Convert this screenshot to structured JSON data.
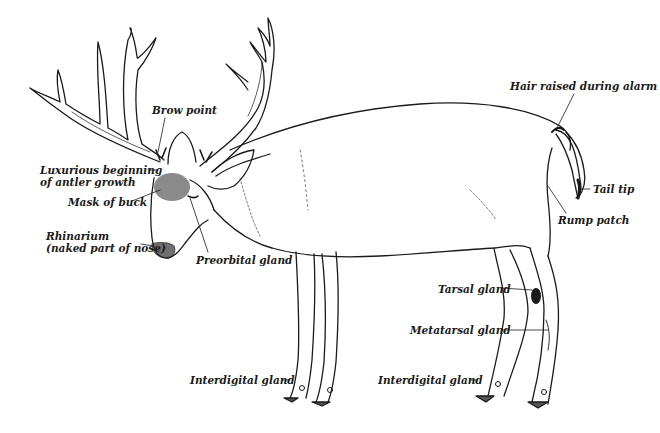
{
  "diagram": {
    "colors": {
      "ink": "#1a1a1a",
      "background": "#ffffff",
      "hoof": "#555555"
    },
    "labels": [
      {
        "id": "brow-point",
        "text": "Brow point"
      },
      {
        "id": "antler-growth-1",
        "text": "Luxurious beginning"
      },
      {
        "id": "antler-growth-2",
        "text": "of antler growth"
      },
      {
        "id": "mask",
        "text": "Mask of buck"
      },
      {
        "id": "rhinarium-1",
        "text": "Rhinarium"
      },
      {
        "id": "rhinarium-2",
        "text": "(naked part of nose)"
      },
      {
        "id": "preorbital",
        "text": "Preorbital gland"
      },
      {
        "id": "hair-raised",
        "text": "Hair raised during alarm"
      },
      {
        "id": "tail-tip",
        "text": "Tail tip"
      },
      {
        "id": "rump-patch",
        "text": "Rump patch"
      },
      {
        "id": "tarsal",
        "text": "Tarsal gland"
      },
      {
        "id": "metatarsal",
        "text": "Metatarsal gland"
      },
      {
        "id": "interdigital-front",
        "text": "Interdigital gland"
      },
      {
        "id": "interdigital-rear",
        "text": "Interdigital gland"
      }
    ]
  }
}
